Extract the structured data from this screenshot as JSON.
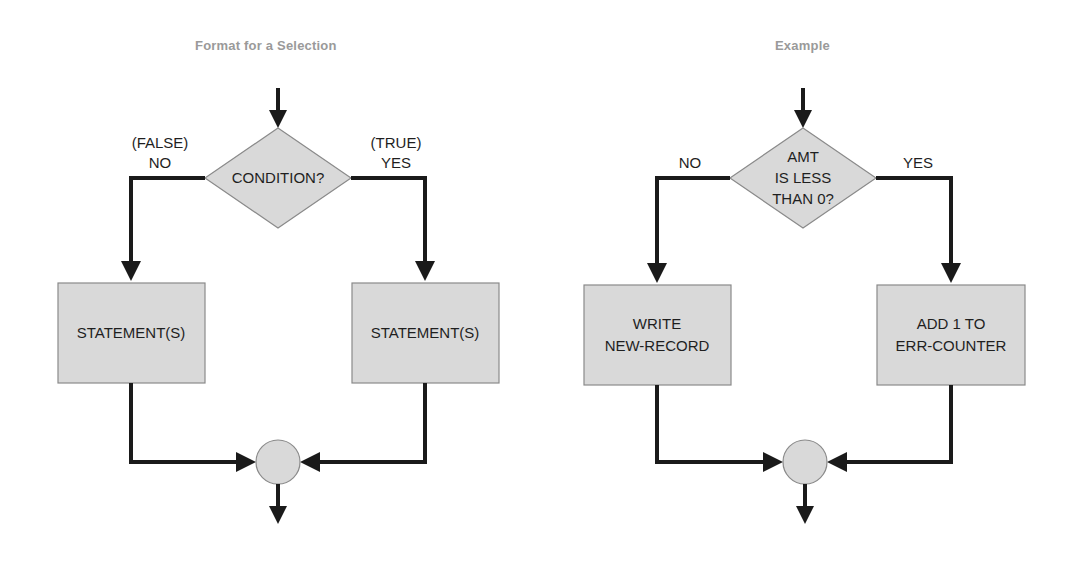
{
  "figure": {
    "kind": "flowchart",
    "panels": [
      {
        "id": "format",
        "title": "Format for a Selection",
        "title_color": "#9a9a9a",
        "decision": {
          "shape": "diamond",
          "lines": [
            "CONDITION?"
          ]
        },
        "branch_left": {
          "line1": "(FALSE)",
          "line2": "NO"
        },
        "branch_right": {
          "line1": "(TRUE)",
          "line2": "YES"
        },
        "process_left": {
          "shape": "rectangle",
          "lines": [
            "STATEMENT(S)"
          ]
        },
        "process_right": {
          "shape": "rectangle",
          "lines": [
            "STATEMENT(S)"
          ]
        },
        "merge": {
          "shape": "circle",
          "label": ""
        }
      },
      {
        "id": "example",
        "title": "Example",
        "title_color": "#9a9a9a",
        "decision": {
          "shape": "diamond",
          "lines": [
            "AMT",
            "IS LESS",
            "THAN 0?"
          ]
        },
        "branch_left": {
          "line1": "",
          "line2": "NO"
        },
        "branch_right": {
          "line1": "",
          "line2": "YES"
        },
        "process_left": {
          "shape": "rectangle",
          "lines": [
            "WRITE",
            "NEW-RECORD"
          ]
        },
        "process_right": {
          "shape": "rectangle",
          "lines": [
            "ADD 1 TO",
            "ERR-COUNTER"
          ]
        },
        "merge": {
          "shape": "circle",
          "label": ""
        }
      }
    ],
    "colors": {
      "shape_fill": "#d9d9d9",
      "shape_stroke": "#8a8a8a",
      "connector": "#1a1a1a",
      "text": "#1f1f1f",
      "background": "#ffffff"
    }
  }
}
